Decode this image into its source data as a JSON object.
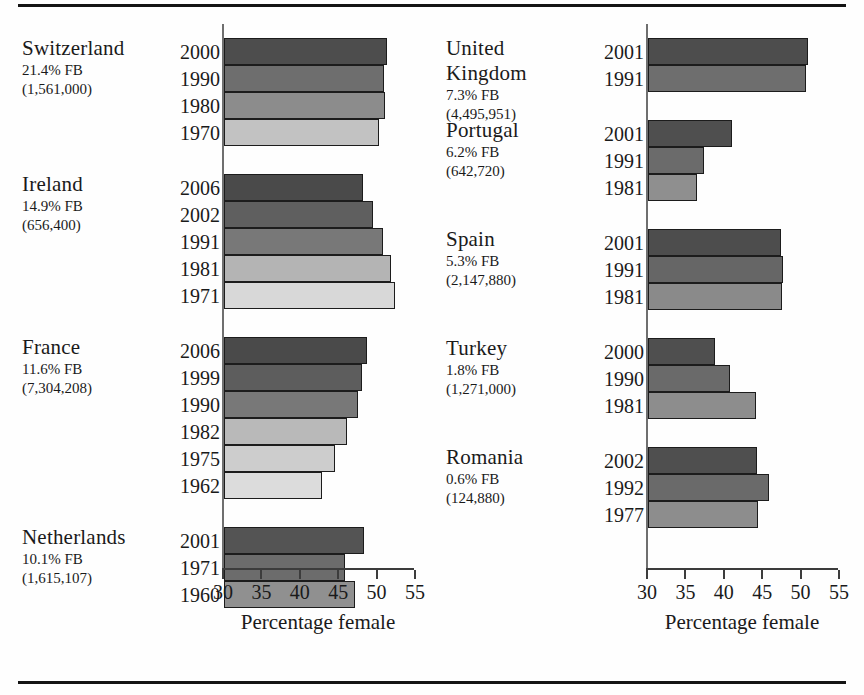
{
  "figure": {
    "axis_title": "Percentage female",
    "tick_labels": [
      "30",
      "35",
      "40",
      "45",
      "50",
      "55"
    ],
    "axis_min": 30,
    "axis_max": 55
  },
  "chart_data": {
    "type": "bar",
    "title": "",
    "xlabel": "Percentage female",
    "ylabel": "",
    "xlim": [
      30,
      55
    ],
    "orientation": "horizontal",
    "grid": false,
    "legend": "none",
    "tick_labels": [
      "30",
      "35",
      "40",
      "45",
      "50",
      "55"
    ],
    "note": "Shading of bars runs dark (most recent census) to light (earliest census) within each country panel.",
    "panels": [
      {
        "position": "left",
        "groups": [
          {
            "country": "Switzerland",
            "fb_percent": "21.4% FB",
            "fb_count": "(1,561,000)",
            "years": [
              "2000",
              "1990",
              "1980",
              "1970"
            ],
            "values": [
              51.2,
              50.8,
              51.0,
              50.2
            ],
            "shades": [
              "#4d4d4d",
              "#6e6e6e",
              "#8c8c8c",
              "#c2c2c2"
            ]
          },
          {
            "country": "Ireland",
            "fb_percent": "14.9% FB",
            "fb_count": "(656,400)",
            "years": [
              "2006",
              "2002",
              "1991",
              "1981",
              " 1971"
            ],
            "years_list": [
              "2006",
              "2002",
              "1991",
              "1981",
              "1971"
            ],
            "values": [
              48.1,
              49.4,
              50.7,
              51.7,
              52.3
            ],
            "shades": [
              "#4a4a4a",
              "#5f5f5f",
              "#787878",
              "#b4b4b4",
              "#d8d8d8"
            ]
          },
          {
            "country": "France",
            "fb_percent": "11.6% FB",
            "fb_count": "(7,304,208)",
            "years": [
              "2006",
              "1999",
              "1990",
              "1982",
              "1975",
              "1962"
            ],
            "values": [
              48.6,
              48.0,
              47.4,
              46.0,
              44.4,
              42.8
            ],
            "shades": [
              "#4a4a4a",
              "#5d5d5d",
              "#787878",
              "#b9b9b9",
              "#cdcdcd",
              "#dcdcdc"
            ]
          },
          {
            "country": "Netherlands",
            "fb_percent": "10.1% FB",
            "fb_count": "(1,615,107)",
            "years": [
              "2001",
              "1971",
              "1960"
            ],
            "values": [
              48.2,
              45.8,
              47.0
            ],
            "shades": [
              "#545454",
              "#6c6c6c",
              "#909090"
            ]
          }
        ]
      },
      {
        "position": "right",
        "groups": [
          {
            "country": "United\nKingdom",
            "fb_percent": "7.3% FB",
            "fb_count": "(4,495,951)",
            "years": [
              "2001",
              "1991"
            ],
            "values": [
              50.8,
              50.6
            ],
            "shades": [
              "#4d4d4d",
              "#6e6e6e"
            ]
          },
          {
            "country": "Portugal",
            "fb_percent": "6.2% FB",
            "fb_count": "(642,720)",
            "years": [
              "2001",
              "1991",
              "1981"
            ],
            "values": [
              40.9,
              37.3,
              36.4
            ],
            "shades": [
              "#4f4f4f",
              "#6b6b6b",
              "#8f8f8f"
            ]
          },
          {
            "country": "Spain",
            "fb_percent": "5.3% FB",
            "fb_count": "(2,147,880)",
            "years": [
              "2001",
              "1991",
              "1981"
            ],
            "values": [
              47.3,
              47.6,
              47.4
            ],
            "shades": [
              "#4d4d4d",
              "#666666",
              "#8a8a8a"
            ]
          },
          {
            "country": "Turkey",
            "fb_percent": "1.8% FB",
            "fb_count": "(1,271,000)",
            "years": [
              "2000",
              "1990",
              "1981"
            ],
            "values": [
              38.7,
              40.7,
              44.0
            ],
            "shades": [
              "#4f4f4f",
              "#6a6a6a",
              "#8d8d8d"
            ]
          },
          {
            "country": "Romania",
            "fb_percent": "0.6% FB",
            "fb_count": "(124,880)",
            "years": [
              "2002",
              "1992",
              "1977"
            ],
            "values": [
              44.2,
              45.8,
              44.3
            ],
            "shades": [
              "#4f4f4f",
              "#6a6a6a",
              "#8d8d8d"
            ]
          }
        ]
      }
    ]
  }
}
